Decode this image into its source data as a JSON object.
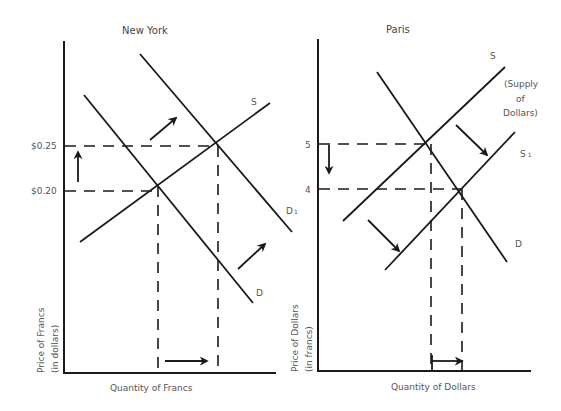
{
  "panels": {
    "new_york": {
      "title": "New York",
      "y_axis_label_line1": "Price of Francs",
      "y_axis_label_line2": "(in dollars)",
      "x_axis_label": "Quantity of Francs",
      "price_ticks": [
        "$0.25",
        "$0.20"
      ],
      "curves": {
        "supply": "S",
        "demand": "D",
        "demand_shifted": "D",
        "demand_shifted_subscript": "1"
      }
    },
    "paris": {
      "title": "Paris",
      "y_axis_label_line1": "Price of Dollars",
      "y_axis_label_line2": "(in francs)",
      "x_axis_label": "Quantity of Dollars",
      "price_ticks": [
        "5",
        "4"
      ],
      "curves": {
        "supply": "S",
        "supply_note_line1": "(Supply",
        "supply_note_line2": "of",
        "supply_note_line3": "Dollars)",
        "supply_shifted": "S",
        "supply_shifted_subscript": "1",
        "demand": "D"
      }
    }
  },
  "colors": {
    "line": "#1a1a1a",
    "text": "#555555",
    "background": "#ffffff"
  }
}
